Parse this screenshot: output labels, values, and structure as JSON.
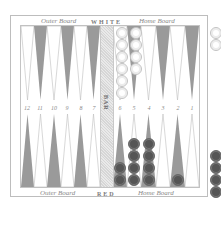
{
  "board": {
    "top_left_label": "Outer Board",
    "top_center_label": "WHITE",
    "top_right_label": "Home Board",
    "bottom_left_label": "Outer Board",
    "bottom_center_label": "RED",
    "bottom_right_label": "Home Board",
    "bar_label": "BAR",
    "point_numbers": [
      "12",
      "11",
      "10",
      "9",
      "8",
      "7",
      "6",
      "5",
      "4",
      "3",
      "2",
      "1"
    ]
  },
  "colors": {
    "dark_point": "#9a9a9a",
    "light_point": "#ffffff",
    "red_checker": "#555555",
    "white_checker": "#ffffff"
  },
  "checkers": {
    "white_on_board": [
      {
        "point": 6,
        "count": 6
      },
      {
        "point": 5,
        "count": 4
      }
    ],
    "red_on_board": [
      {
        "point": 6,
        "count": 2
      },
      {
        "point": 5,
        "count": 4
      },
      {
        "point": 4,
        "count": 4
      },
      {
        "point": 2,
        "count": 1
      }
    ],
    "white_borne_off": 2,
    "red_borne_off": 4
  }
}
